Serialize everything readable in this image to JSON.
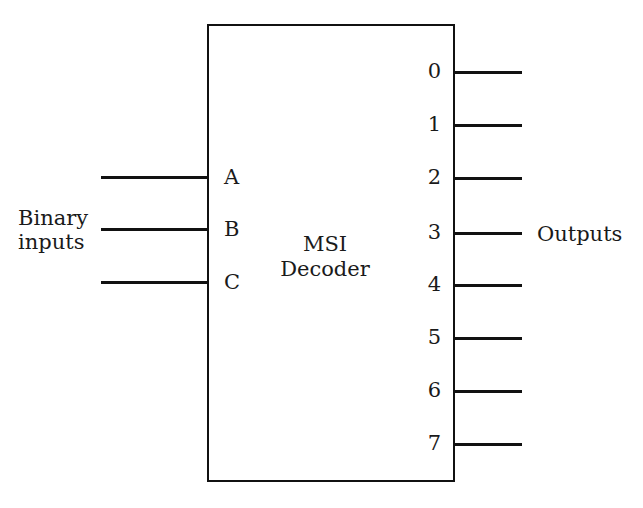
{
  "figure": {
    "kind": "block-diagram",
    "subject": "MSI Decoder",
    "block": {
      "title_line1": "MSI",
      "title_line2": "Decoder"
    },
    "inputs": {
      "group_label_line1": "Binary",
      "group_label_line2": "inputs",
      "pins": [
        {
          "label": "A"
        },
        {
          "label": "B"
        },
        {
          "label": "C"
        }
      ]
    },
    "outputs": {
      "group_label": "Outputs",
      "pins": [
        {
          "label": "0"
        },
        {
          "label": "1"
        },
        {
          "label": "2"
        },
        {
          "label": "3"
        },
        {
          "label": "4"
        },
        {
          "label": "5"
        },
        {
          "label": "6"
        },
        {
          "label": "7"
        }
      ]
    },
    "colors": {
      "ink": "#111111",
      "paper": "#ffffff"
    }
  }
}
